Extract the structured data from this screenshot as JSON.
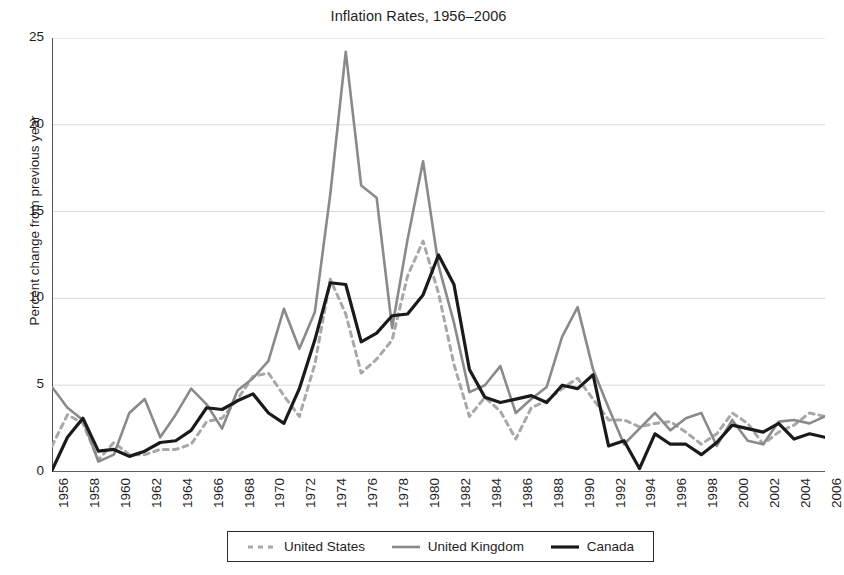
{
  "chart_data": {
    "type": "line",
    "title": "Inflation Rates, 1956–2006",
    "xlabel": "",
    "ylabel": "Percent change from previous year",
    "xlim": [
      1956,
      2006
    ],
    "ylim": [
      0,
      25
    ],
    "yticks": [
      0,
      5,
      10,
      15,
      20,
      25
    ],
    "ytick_labels": [
      "0",
      "5",
      "10",
      "15",
      "20",
      "25"
    ],
    "xticks": [
      1956,
      1958,
      1960,
      1962,
      1964,
      1966,
      1968,
      1970,
      1972,
      1974,
      1976,
      1978,
      1980,
      1982,
      1984,
      1986,
      1988,
      1990,
      1992,
      1994,
      1996,
      1998,
      2000,
      2002,
      2004,
      2006
    ],
    "xtick_labels": [
      "1956",
      "1958",
      "1960",
      "1962",
      "1964",
      "1966",
      "1968",
      "1970",
      "1972",
      "1974",
      "1976",
      "1978",
      "1980",
      "1982",
      "1984",
      "1986",
      "1988",
      "1990",
      "1992",
      "1994",
      "1996",
      "1998",
      "2000",
      "2002",
      "2004",
      "2006"
    ],
    "grid": true,
    "grid_axis": "y",
    "legend_position": "bottom",
    "x": [
      1956,
      1957,
      1958,
      1959,
      1960,
      1961,
      1962,
      1963,
      1964,
      1965,
      1966,
      1967,
      1968,
      1969,
      1970,
      1971,
      1972,
      1973,
      1974,
      1975,
      1976,
      1977,
      1978,
      1979,
      1980,
      1981,
      1982,
      1983,
      1984,
      1985,
      1986,
      1987,
      1988,
      1989,
      1990,
      1991,
      1992,
      1993,
      1994,
      1995,
      1996,
      1997,
      1998,
      1999,
      2000,
      2001,
      2002,
      2003,
      2004,
      2005,
      2006
    ],
    "series": [
      {
        "name": "United States",
        "style": "dashed",
        "color": "#a8a8a8",
        "width": 3.0,
        "values": [
          1.5,
          3.3,
          2.8,
          0.7,
          1.7,
          1.0,
          1.0,
          1.3,
          1.3,
          1.6,
          2.9,
          3.1,
          4.2,
          5.5,
          5.7,
          4.4,
          3.2,
          6.2,
          11.1,
          9.1,
          5.7,
          6.5,
          7.6,
          11.3,
          13.3,
          10.3,
          6.2,
          3.2,
          4.3,
          3.5,
          1.9,
          3.7,
          4.1,
          4.8,
          5.4,
          4.2,
          3.0,
          3.0,
          2.6,
          2.8,
          2.9,
          2.3,
          1.6,
          2.2,
          3.4,
          2.8,
          1.6,
          2.3,
          2.7,
          3.4,
          3.2
        ]
      },
      {
        "name": "United Kingdom",
        "style": "solid",
        "color": "#8a8a8a",
        "width": 2.6,
        "values": [
          4.9,
          3.7,
          3.0,
          0.6,
          1.0,
          3.4,
          4.2,
          2.0,
          3.3,
          4.8,
          3.9,
          2.5,
          4.7,
          5.4,
          6.4,
          9.4,
          7.1,
          9.2,
          16.0,
          24.2,
          16.5,
          15.8,
          8.3,
          13.4,
          17.9,
          11.9,
          8.6,
          4.6,
          5.0,
          6.1,
          3.4,
          4.2,
          4.9,
          7.8,
          9.5,
          5.9,
          3.7,
          1.6,
          2.5,
          3.4,
          2.4,
          3.1,
          3.4,
          1.5,
          3.0,
          1.8,
          1.6,
          2.9,
          3.0,
          2.8,
          3.2
        ]
      },
      {
        "name": "Canada",
        "style": "solid",
        "color": "#1a1a1a",
        "width": 3.2,
        "values": [
          0.1,
          2.0,
          3.1,
          1.2,
          1.3,
          0.9,
          1.2,
          1.7,
          1.8,
          2.4,
          3.7,
          3.6,
          4.1,
          4.5,
          3.4,
          2.8,
          4.8,
          7.6,
          10.9,
          10.8,
          7.5,
          8.0,
          9.0,
          9.1,
          10.2,
          12.5,
          10.8,
          5.9,
          4.3,
          4.0,
          4.2,
          4.4,
          4.0,
          5.0,
          4.8,
          5.6,
          1.5,
          1.8,
          0.2,
          2.2,
          1.6,
          1.6,
          1.0,
          1.7,
          2.7,
          2.5,
          2.3,
          2.8,
          1.9,
          2.2,
          2.0
        ]
      }
    ]
  },
  "legend": {
    "entries": [
      {
        "label": "United States",
        "swatch": "dashed-light-gray-line"
      },
      {
        "label": "United Kingdom",
        "swatch": "solid-gray-line"
      },
      {
        "label": "Canada",
        "swatch": "solid-black-line"
      }
    ]
  },
  "colors": {
    "united_states": "#a8a8a8",
    "united_kingdom": "#8a8a8a",
    "canada": "#1a1a1a",
    "axis": "#2b2b2b",
    "grid": "#d8d8dd",
    "background": "#ffffff"
  }
}
